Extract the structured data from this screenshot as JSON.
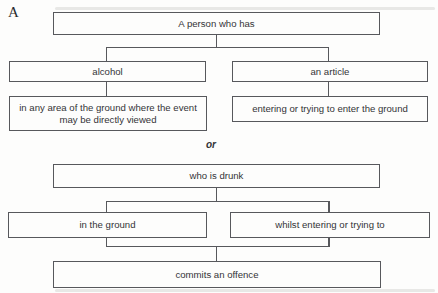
{
  "figure": {
    "label": "A",
    "or_separator": "or",
    "nodes": {
      "person": "A person who has",
      "alcohol": "alcohol",
      "article": "an article",
      "area": "in any area of the ground where the event may be directly viewed",
      "entering": "entering or trying to enter the ground",
      "drunk": "who is drunk",
      "ground": "in the ground",
      "whilst": "whilst entering or trying to",
      "offence": "commits an offence"
    },
    "colors": {
      "border": "#57585c",
      "connector": "#57585c",
      "text": "#343437",
      "background": "#fdfdfc"
    }
  }
}
